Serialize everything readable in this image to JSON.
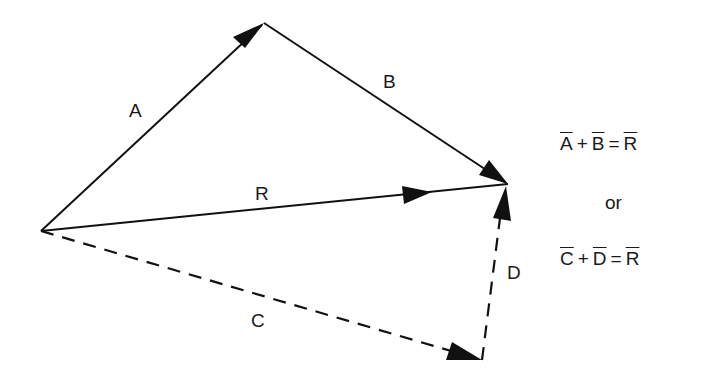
{
  "diagram": {
    "type": "vector-addition",
    "colors": {
      "stroke": "#111111",
      "background": "#ffffff"
    },
    "vectors": [
      {
        "name": "A",
        "label": "A",
        "style": "solid",
        "from": [
          41,
          231
        ],
        "to": [
          264,
          23
        ]
      },
      {
        "name": "B",
        "label": "B",
        "style": "solid",
        "from": [
          264,
          23
        ],
        "to": [
          508,
          184
        ]
      },
      {
        "name": "R",
        "label": "R",
        "style": "solid",
        "from": [
          41,
          231
        ],
        "to": [
          508,
          184
        ]
      },
      {
        "name": "C",
        "label": "C",
        "style": "dashed",
        "from": [
          41,
          231
        ],
        "to": [
          482,
          360
        ]
      },
      {
        "name": "D",
        "label": "D",
        "style": "dashed",
        "from": [
          482,
          360
        ],
        "to": [
          508,
          184
        ]
      }
    ],
    "labels": {
      "A": "A",
      "B": "B",
      "R": "R",
      "C": "C",
      "D": "D"
    },
    "equations": {
      "eq1": {
        "t1": "A",
        "op1": "+",
        "t2": "B",
        "op2": "=",
        "t3": "R"
      },
      "connector": "or",
      "eq2": {
        "t1": "C",
        "op1": "+",
        "t2": "D",
        "op2": "=",
        "t3": "R"
      }
    }
  }
}
